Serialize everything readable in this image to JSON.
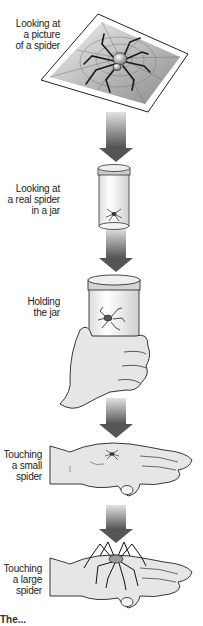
{
  "diagram": {
    "type": "vertical-hierarchy",
    "steps": [
      {
        "label_lines": [
          "Looking at",
          "a picture",
          "of a spider"
        ],
        "illustration": "framed-picture-of-spider-on-web"
      },
      {
        "label_lines": [
          "Looking at",
          "a real spider",
          "in a jar"
        ],
        "illustration": "small-jar-with-spider"
      },
      {
        "label_lines": [
          "Holding",
          "the jar"
        ],
        "illustration": "hand-holding-jar-with-spider"
      },
      {
        "label_lines": [
          "Touching",
          "a small",
          "spider"
        ],
        "illustration": "open-hand-with-small-spider"
      },
      {
        "label_lines": [
          "Touching",
          "a large",
          "spider"
        ],
        "illustration": "open-hand-with-large-spider"
      }
    ],
    "connectors": "gray-gradient-down-arrows",
    "caption": "The..."
  },
  "colors": {
    "arrow_light": "#d8d8d8",
    "arrow_dark": "#555555",
    "outline": "#222222",
    "fill_light": "#e6e6e6"
  }
}
